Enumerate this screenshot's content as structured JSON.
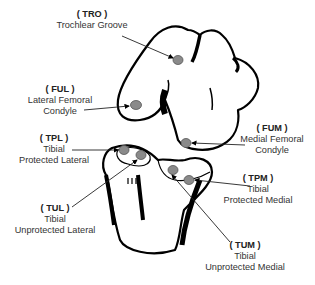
{
  "diagram": {
    "type": "anatomical knee joint cartilage regions",
    "regions": [
      {
        "code": "TRO",
        "lines": [
          "Trochlear Groove"
        ]
      },
      {
        "code": "FUL",
        "lines": [
          "Lateral Femoral",
          "Condyle"
        ]
      },
      {
        "code": "FUM",
        "lines": [
          "Medial Femoral",
          "Condyle"
        ]
      },
      {
        "code": "TPL",
        "lines": [
          "Tibial",
          "Protected Lateral"
        ]
      },
      {
        "code": "TPM",
        "lines": [
          "Tibial",
          "Protected Medial"
        ]
      },
      {
        "code": "TUL",
        "lines": [
          "Tibial",
          "Unprotected Lateral"
        ]
      },
      {
        "code": "TUM",
        "lines": [
          "Tibial",
          "Unprotected Medial"
        ]
      }
    ],
    "colors": {
      "outline": "#000000",
      "marker_fill": "#8a8a8a",
      "text": "#333333"
    }
  }
}
